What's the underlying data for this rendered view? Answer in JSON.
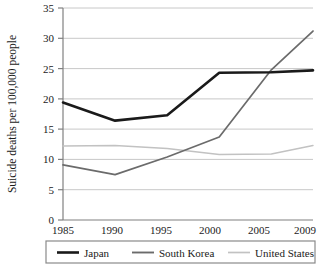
{
  "chart_data": {
    "type": "line",
    "title": "",
    "xlabel": "",
    "ylabel": "Suicide deaths per 100,000 people",
    "categories": [
      "1985",
      "1990",
      "1995",
      "2000",
      "2005",
      "2009"
    ],
    "x": [
      1985,
      1990,
      1995,
      2000,
      2005,
      2009
    ],
    "xlim": [
      1985,
      2009
    ],
    "ylim": [
      0,
      35
    ],
    "ytick_values": [
      0,
      5,
      10,
      15,
      20,
      25,
      30,
      35
    ],
    "ytick_labels": [
      "0",
      "5",
      "10",
      "15",
      "20",
      "25",
      "30",
      "35"
    ],
    "xtick_labels": [
      "1985",
      "1990",
      "1995",
      "2000",
      "2005",
      "2009"
    ],
    "grid": "horizontal",
    "legend_position": "bottom",
    "series": [
      {
        "name": "Japan",
        "color": "#1a1a1a",
        "width": 2.6,
        "values": [
          19.4,
          16.4,
          17.3,
          24.3,
          24.4,
          24.7
        ]
      },
      {
        "name": "South Korea",
        "color": "#6b6b6b",
        "width": 1.7,
        "values": [
          9.1,
          7.5,
          10.4,
          13.7,
          24.8,
          31.2
        ]
      },
      {
        "name": "United States",
        "color": "#c2c2c2",
        "width": 1.5,
        "values": [
          12.2,
          12.3,
          11.8,
          10.8,
          10.9,
          12.3
        ]
      }
    ]
  },
  "axes": {
    "y_title": "Suicide deaths per 100,000 people",
    "y_ticks": [
      "35",
      "30",
      "25",
      "20",
      "15",
      "10",
      "5",
      "0"
    ],
    "x_ticks": [
      "1985",
      "1990",
      "1995",
      "2000",
      "2005",
      "2009"
    ]
  },
  "legend": {
    "items": [
      {
        "label": "Japan",
        "color": "#1a1a1a"
      },
      {
        "label": "South Korea",
        "color": "#6b6b6b"
      },
      {
        "label": "United States",
        "color": "#c2c2c2"
      }
    ]
  },
  "style": {
    "background": "#ffffff",
    "axis_color": "#808080",
    "grid_color": "#c8c8c8",
    "legend_border": "#8a8a8a",
    "text_color": "#1a1a1a"
  }
}
